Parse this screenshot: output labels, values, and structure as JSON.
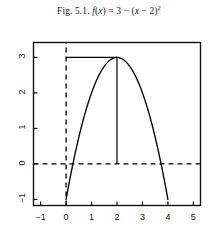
{
  "caption": {
    "figure_number": "Fig. 5.1.",
    "function_text": "f(x) = 3 − (x − 2)²",
    "f": "f",
    "paren_open": "(",
    "var_x": "x",
    "paren_close": ")",
    "equals": " = ",
    "three": "3",
    "minus": " − ",
    "paren_open2": "(",
    "var_x2": "x",
    "minus2": " − ",
    "two": "2",
    "paren_close2": ")",
    "exponent": "2"
  },
  "chart_data": {
    "type": "line",
    "xlabel": "",
    "ylabel": "",
    "xlim": [
      -1.28,
      5.28
    ],
    "ylim": [
      -1.17,
      3.42
    ],
    "xticks": [
      -1,
      0,
      1,
      2,
      3,
      4,
      5
    ],
    "xtick_labels": [
      "−1",
      "0",
      "1",
      "2",
      "3",
      "4",
      "5"
    ],
    "yticks": [
      -1,
      0,
      1,
      2,
      3
    ],
    "ytick_labels": [
      "−1",
      "0",
      "1",
      "2",
      "3"
    ],
    "grid": false,
    "legend": null,
    "frame": true,
    "series": [
      {
        "name": "f(x) = 3 − (x − 2)^2",
        "style": "solid",
        "color": "#000000",
        "x": [
          0.0,
          0.2,
          0.4,
          0.6,
          0.8,
          1.0,
          1.2,
          1.4,
          1.6,
          1.8,
          2.0,
          2.2,
          2.4,
          2.6,
          2.8,
          3.0,
          3.2,
          3.4,
          3.6,
          3.8,
          4.0
        ],
        "y": [
          -1.0,
          -0.24,
          0.44,
          1.04,
          1.56,
          2.0,
          2.36,
          2.64,
          2.84,
          2.96,
          3.0,
          2.96,
          2.84,
          2.64,
          2.36,
          2.0,
          1.56,
          1.04,
          0.44,
          -0.24,
          -1.0
        ]
      }
    ],
    "annotations": [
      {
        "name": "vertex-horizontal-guide",
        "type": "segment",
        "style": "solid",
        "x": [
          0,
          2
        ],
        "y": [
          3,
          3
        ]
      },
      {
        "name": "vertex-vertical-guide",
        "type": "segment",
        "style": "solid",
        "x": [
          2,
          2
        ],
        "y": [
          3,
          0
        ]
      },
      {
        "name": "y-axis-dashed",
        "type": "segment",
        "style": "dashed",
        "x": [
          0,
          0
        ],
        "y": [
          -1.17,
          3.42
        ]
      },
      {
        "name": "x-axis-dashed",
        "type": "segment",
        "style": "dashed",
        "x": [
          -1.28,
          5.28
        ],
        "y": [
          0,
          0
        ]
      }
    ],
    "vertex": {
      "x": 2,
      "y": 3
    },
    "roots": [
      0.268,
      3.732
    ]
  },
  "colors": {
    "curve": "#000000",
    "frame": "#111111",
    "text": "#161616",
    "background": "#ffffff"
  }
}
